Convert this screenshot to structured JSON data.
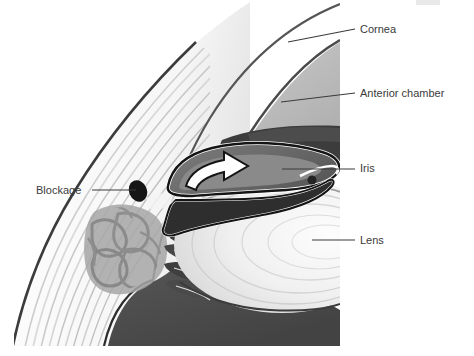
{
  "figure": {
    "canvas": {
      "width": 474,
      "height": 356
    },
    "background_color": "#ffffff",
    "illustration_bounds": {
      "x": 14,
      "y": 0,
      "width": 326,
      "height": 346
    }
  },
  "labels": [
    {
      "id": "cornea",
      "text": "Cornea",
      "text_x": 360,
      "text_y": 33,
      "leader": {
        "x1": 288,
        "y1": 42,
        "x2": 355,
        "y2": 29
      }
    },
    {
      "id": "anterior-chamber",
      "text": "Anterior chamber",
      "text_x": 360,
      "text_y": 97,
      "leader": {
        "x1": 281,
        "y1": 102,
        "x2": 355,
        "y2": 93
      }
    },
    {
      "id": "iris",
      "text": "Iris",
      "text_x": 360,
      "text_y": 172,
      "leader": {
        "x1": 282,
        "y1": 169,
        "x2": 355,
        "y2": 169
      }
    },
    {
      "id": "lens",
      "text": "Lens",
      "text_x": 360,
      "text_y": 244,
      "leader": {
        "x1": 312,
        "y1": 240,
        "x2": 355,
        "y2": 240
      }
    },
    {
      "id": "blockage",
      "text": "Blockage",
      "text_x": 36,
      "text_y": 194,
      "text_anchor": "start",
      "leader": {
        "x1": 92,
        "y1": 190,
        "x2": 136,
        "y2": 190
      }
    }
  ],
  "structures": [
    {
      "id": "cornea",
      "name": "cornea",
      "fill": "#ffffff",
      "stroke": "#4a4a4a"
    },
    {
      "id": "anterior-chamber",
      "name": "anterior-chamber",
      "fill": "#b4b4b4"
    },
    {
      "id": "iris",
      "name": "iris",
      "fill": "#6e6e6e",
      "stroke": "#1a1a1a"
    },
    {
      "id": "lens",
      "name": "lens",
      "fill": "#f2f2f2",
      "stroke": "#9a9a9a"
    },
    {
      "id": "blockage",
      "name": "blockage",
      "fill": "#1a1a1a"
    },
    {
      "id": "sclera",
      "name": "sclera",
      "fill": "#ffffff",
      "stroke": "#3c3c3c"
    },
    {
      "id": "trabecular-meshwork",
      "name": "trabecular-meshwork",
      "fill": "#9e9e9e"
    },
    {
      "id": "vitreous",
      "name": "vitreous-body",
      "fill": "#4c4c4c"
    },
    {
      "id": "flow-arrow",
      "name": "aqueous-flow-arrow",
      "fill": "#ffffff",
      "stroke": "#141414"
    }
  ],
  "colors": {
    "background": "#ffffff",
    "line_dark": "#3b3b3b",
    "outline": "#1a1a1a",
    "chamber_gray": "#b4b4b4",
    "iris_gray": "#6e6e6e",
    "vitreous_dark": "#4c4c4c",
    "lens_light": "#f2f2f2",
    "meshwork_gray": "#9e9e9e",
    "artifact_gray": "#e2e2e2"
  },
  "artifact": {
    "name": "top-right-smudge",
    "x": 416,
    "y": 0,
    "width": 24,
    "height": 5
  }
}
